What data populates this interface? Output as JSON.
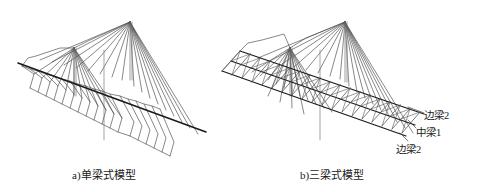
{
  "figure": {
    "title_a": "a)单梁式模型",
    "title_b": "b)三梁式模型",
    "background_color": "#ffffff",
    "line_color": "#555555",
    "deck_color": "#1a1a1a",
    "text_color": "#1a1a1a"
  },
  "model_a": {
    "name": "single-girder-model",
    "caption": "a)单梁式模型",
    "beam_count": 1,
    "pylon_count": 2,
    "cable_pairs_per_pylon": 8
  },
  "model_b": {
    "name": "triple-girder-model",
    "caption": "b)三梁式模型",
    "beam_count": 3,
    "pylon_count": 2,
    "cable_pairs_per_pylon": 8,
    "labels": [
      {
        "id": "edge-beam-top",
        "text": "边梁2"
      },
      {
        "id": "center-beam",
        "text": "中梁1"
      },
      {
        "id": "edge-beam-bottom",
        "text": "边梁2"
      }
    ]
  }
}
